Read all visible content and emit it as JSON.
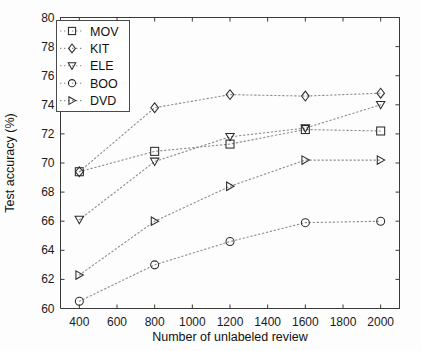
{
  "chart_data": {
    "type": "scatter",
    "title": "",
    "xlabel": "Number of unlabeled review",
    "ylabel": "Test accuracy (%)",
    "xlim": [
      300,
      2100
    ],
    "ylim": [
      60,
      80
    ],
    "xticks": [
      400,
      600,
      800,
      1000,
      1200,
      1400,
      1600,
      1800,
      2000
    ],
    "yticks": [
      60,
      62,
      64,
      66,
      68,
      70,
      72,
      74,
      76,
      78,
      80
    ],
    "xtick_labels": [
      "400",
      "600",
      "800",
      "1000",
      "1200",
      "1400",
      "1600",
      "1800",
      "2000"
    ],
    "ytick_labels": [
      "60",
      "62",
      "64",
      "66",
      "68",
      "70",
      "72",
      "74",
      "76",
      "78",
      "80"
    ],
    "grid": false,
    "legend_position": "upper left",
    "x": [
      400,
      800,
      1200,
      1600,
      2000
    ],
    "series": [
      {
        "name": "MOV",
        "marker": "square",
        "values": [
          69.4,
          70.8,
          71.3,
          72.3,
          72.2
        ]
      },
      {
        "name": "KIT",
        "marker": "diamond",
        "values": [
          69.4,
          73.8,
          74.7,
          74.6,
          74.8
        ]
      },
      {
        "name": "ELE",
        "marker": "triangle-down",
        "values": [
          66.1,
          70.1,
          71.8,
          72.4,
          74.0
        ]
      },
      {
        "name": "BOO",
        "marker": "circle",
        "values": [
          60.5,
          63.0,
          64.6,
          65.9,
          66.0
        ]
      },
      {
        "name": "DVD",
        "marker": "triangle-right",
        "values": [
          62.3,
          66.0,
          68.4,
          70.2,
          70.2
        ]
      }
    ],
    "colors": {
      "marker_stroke": "#2b2b2b",
      "line_stroke": "#8c8c8c",
      "axis": "#3a3a3a",
      "background": "#ffffff"
    }
  },
  "legend": {
    "entries": [
      "MOV",
      "KIT",
      "ELE",
      "BOO",
      "DVD"
    ]
  }
}
